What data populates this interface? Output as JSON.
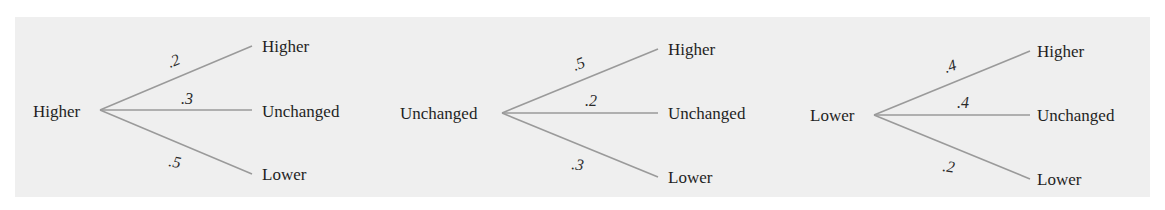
{
  "diagram": {
    "type": "probability-tree",
    "colors": {
      "background": "#ffffff",
      "panel": "#efefef",
      "line": "#9a9a9a",
      "text": "#1f1f1f"
    },
    "trees": [
      {
        "root": {
          "label": "Higher",
          "x": 33,
          "y": 117
        },
        "origin": {
          "x": 100,
          "y": 110
        },
        "branches": [
          {
            "label": "Higher",
            "prob": ".2",
            "end": {
              "x": 252,
              "y": 46
            },
            "label_pos": {
              "x": 262,
              "y": 52
            },
            "prob_pos": {
              "x": 170,
              "y": 68
            },
            "prob_rot": -22
          },
          {
            "label": "Unchanged",
            "prob": ".3",
            "end": {
              "x": 252,
              "y": 110
            },
            "label_pos": {
              "x": 262,
              "y": 117
            },
            "prob_pos": {
              "x": 181,
              "y": 104
            },
            "prob_rot": 0
          },
          {
            "label": "Lower",
            "prob": ".5",
            "end": {
              "x": 252,
              "y": 174
            },
            "label_pos": {
              "x": 262,
              "y": 180
            },
            "prob_pos": {
              "x": 168,
              "y": 166
            },
            "prob_rot": 10
          }
        ]
      },
      {
        "root": {
          "label": "Unchanged",
          "x": 400,
          "y": 119
        },
        "origin": {
          "x": 502,
          "y": 113
        },
        "branches": [
          {
            "label": "Higher",
            "prob": ".5",
            "end": {
              "x": 658,
              "y": 49
            },
            "label_pos": {
              "x": 668,
              "y": 55
            },
            "prob_pos": {
              "x": 575,
              "y": 71
            },
            "prob_rot": -22
          },
          {
            "label": "Unchanged",
            "prob": ".2",
            "end": {
              "x": 658,
              "y": 113
            },
            "label_pos": {
              "x": 668,
              "y": 119
            },
            "prob_pos": {
              "x": 585,
              "y": 106
            },
            "prob_rot": 0
          },
          {
            "label": "Lower",
            "prob": ".3",
            "end": {
              "x": 658,
              "y": 177
            },
            "label_pos": {
              "x": 668,
              "y": 183
            },
            "prob_pos": {
              "x": 571,
              "y": 169
            },
            "prob_rot": 8
          }
        ]
      },
      {
        "root": {
          "label": "Lower",
          "x": 810,
          "y": 121
        },
        "origin": {
          "x": 874,
          "y": 115
        },
        "branches": [
          {
            "label": "Higher",
            "prob": ".4",
            "end": {
              "x": 1030,
              "y": 51
            },
            "label_pos": {
              "x": 1037,
              "y": 57
            },
            "prob_pos": {
              "x": 946,
              "y": 73
            },
            "prob_rot": -18
          },
          {
            "label": "Unchanged",
            "prob": ".4",
            "end": {
              "x": 1030,
              "y": 115
            },
            "label_pos": {
              "x": 1037,
              "y": 121
            },
            "prob_pos": {
              "x": 957,
              "y": 108
            },
            "prob_rot": 0
          },
          {
            "label": "Lower",
            "prob": ".2",
            "end": {
              "x": 1030,
              "y": 179
            },
            "label_pos": {
              "x": 1037,
              "y": 185
            },
            "prob_pos": {
              "x": 942,
              "y": 171
            },
            "prob_rot": 8
          }
        ]
      }
    ]
  }
}
